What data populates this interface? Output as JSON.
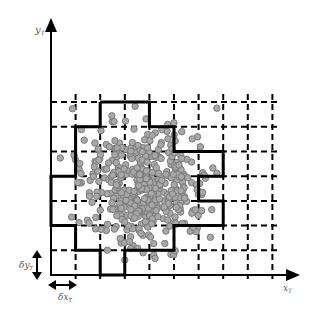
{
  "diagram": {
    "type": "grid-cell-occupancy",
    "axes": {
      "x_label": "x",
      "x_subscript": "T",
      "y_label": "y",
      "y_subscript": "T"
    },
    "cell_size_labels": {
      "dx": "δx",
      "dx_subscript": "T",
      "dy": "δy",
      "dy_subscript": "T"
    },
    "grid": {
      "columns": 9,
      "rows": 7,
      "origin_px": [
        51,
        275
      ],
      "cell_w_px": 24.6,
      "cell_h_px": 24.7,
      "line_style": "dashed"
    },
    "boundary_outline": "thick solid polygon enclosing occupied cells",
    "points": {
      "count_approx": 450,
      "color": "#a8a8a8",
      "stroke": "#7a7a7a",
      "center_px": [
        145,
        185
      ],
      "spread_px": [
        32,
        30
      ]
    },
    "colors": {
      "axis": "#000000",
      "grid": "#000000",
      "boundary": "#000000",
      "label": "#555555"
    }
  }
}
